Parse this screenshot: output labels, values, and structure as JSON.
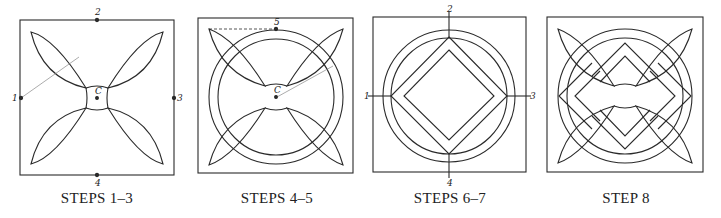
{
  "figure": {
    "panels": [
      {
        "id": "steps-1-3",
        "caption": "STEPS 1–3",
        "point_labels": {
          "top": "2",
          "left": "1",
          "right": "3",
          "bottom": "4",
          "center": "C"
        }
      },
      {
        "id": "steps-4-5",
        "caption": "STEPS 4–5",
        "point_labels": {
          "top": "5",
          "center": "C"
        }
      },
      {
        "id": "steps-6-7",
        "caption": "STEPS 6–7",
        "point_labels": {
          "top": "2",
          "left": "1",
          "right": "3",
          "bottom": "4"
        }
      },
      {
        "id": "step-8",
        "caption": "STEP 8"
      }
    ],
    "colors": {
      "line": "#2a2a2a",
      "background": "#ffffff"
    }
  }
}
